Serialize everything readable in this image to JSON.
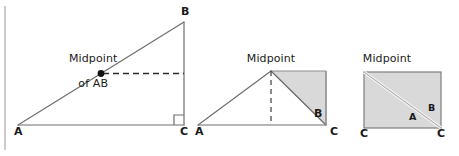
{
  "figure": {
    "width": 459,
    "height": 156,
    "background": "#ffffff",
    "stroke_color": "#6e6e6e",
    "dark_stroke_color": "#4a4a4a",
    "text_color": "#1a1a1a",
    "shade_fill": "#d9d9d9",
    "shade_stroke": "#8c8c8c",
    "rule_color": "#b5b5b5",
    "dot_color": "#111111"
  },
  "left_panel": {
    "name": "right-triangle-with-midpoint",
    "caption_line1": "Midpoint",
    "caption_line2": "of AB",
    "vertex_a": "A",
    "vertex_b": "B",
    "vertex_c": "C",
    "points": {
      "A": [
        18,
        125
      ],
      "B": [
        184,
        22
      ],
      "C": [
        184,
        125
      ],
      "midpoint": [
        101,
        73.5
      ]
    },
    "dashed_segment": {
      "from": [
        101,
        73.5
      ],
      "to": [
        184,
        73.5
      ]
    },
    "right_angle_marker": {
      "corner": [
        184,
        125
      ],
      "size": 10
    }
  },
  "middle_panel": {
    "name": "isosceles-triangle-with-shaded-half",
    "caption": "Midpoint",
    "vertex_a": "A",
    "vertex_b": "B",
    "vertex_c": "C",
    "points": {
      "A": [
        198,
        125
      ],
      "apex": [
        271,
        71
      ],
      "C": [
        326,
        125
      ],
      "top_right": [
        326,
        71
      ]
    },
    "dashed_segment": {
      "from": [
        271,
        71
      ],
      "to": [
        271,
        125
      ]
    },
    "shaded_triangle": [
      [
        271,
        71
      ],
      [
        326,
        71
      ],
      [
        326,
        125
      ]
    ]
  },
  "right_panel": {
    "name": "shaded-rectangle-with-diagonal",
    "caption": "Midpoint",
    "vertex_a": "A",
    "vertex_b": "B",
    "vertex_c_left": "C",
    "vertex_c_right": "C",
    "rect": {
      "x": 364,
      "y": 72,
      "width": 77,
      "height": 56
    },
    "diagonal": {
      "from": [
        364,
        72
      ],
      "to": [
        441,
        128
      ]
    }
  },
  "left_rule": {
    "name": "page-gutter-rule",
    "x": 5,
    "y_top": 6,
    "y_bottom": 150
  }
}
